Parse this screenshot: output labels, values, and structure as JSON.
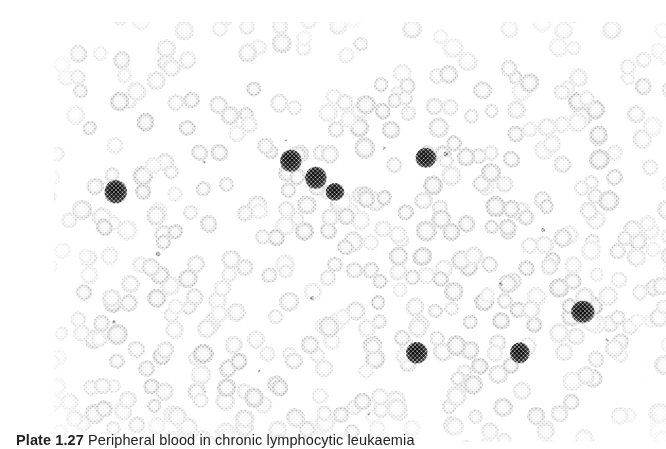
{
  "plate": {
    "caption_label": "Plate 1.27",
    "caption_text": "Peripheral blood in chronic lymphocytic leukaemia",
    "alt_description": "Light micrograph of a peripheral blood smear showing numerous pale red blood cells and several darkly stained leukocyte nuclei",
    "background_color": "#ffffff",
    "cell_color": "#b9b9b9",
    "nucleus_color": "#1b1b1b",
    "paper_color": "#fdfdfd"
  },
  "micrograph": {
    "width": 612,
    "height": 420,
    "erythrocyte_count": 520,
    "erythrocyte_diameter_px": 19,
    "leukocytes": [
      {
        "name": "leukocyte-1",
        "x": 62,
        "y": 170,
        "r": 11.5
      },
      {
        "name": "leukocyte-2",
        "x": 237,
        "y": 139,
        "r": 11.0
      },
      {
        "name": "leukocyte-3",
        "x": 262,
        "y": 156,
        "r": 11.0
      },
      {
        "name": "leukocyte-4",
        "x": 281,
        "y": 170,
        "r": 9.5
      },
      {
        "name": "leukocyte-5",
        "x": 372,
        "y": 136,
        "r": 10.5
      },
      {
        "name": "leukocyte-6",
        "x": 363,
        "y": 331,
        "r": 11.0
      },
      {
        "name": "leukocyte-7",
        "x": 466,
        "y": 331,
        "r": 10.0
      },
      {
        "name": "leukocyte-8",
        "x": 529,
        "y": 290,
        "r": 12.0
      }
    ],
    "debris_specks": [
      {
        "x": 150,
        "y": 140
      },
      {
        "x": 232,
        "y": 118
      },
      {
        "x": 330,
        "y": 126
      },
      {
        "x": 392,
        "y": 132
      },
      {
        "x": 104,
        "y": 232
      },
      {
        "x": 258,
        "y": 276
      },
      {
        "x": 447,
        "y": 262
      },
      {
        "x": 489,
        "y": 208
      },
      {
        "x": 205,
        "y": 349
      },
      {
        "x": 553,
        "y": 318
      },
      {
        "x": 315,
        "y": 392
      },
      {
        "x": 60,
        "y": 300
      }
    ]
  }
}
